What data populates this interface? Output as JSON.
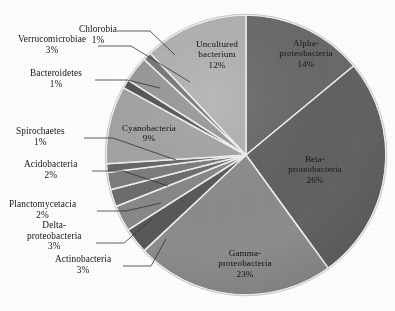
{
  "chart_data": {
    "type": "pie",
    "title": "",
    "subtitle": "",
    "xlabel": "",
    "ylabel": "",
    "legend_position": "none",
    "grid": false,
    "units": "percent",
    "total": 100,
    "start_angle_deg": 0,
    "direction": "clockwise",
    "center": {
      "x": 246,
      "y": 155
    },
    "radius": 140,
    "categories": [
      "Alpha-proteobacteria",
      "Beta-proteobacteria",
      "Gamma-proteobacteria",
      "Actinobacteria",
      "Delta-proteobacteria",
      "Planctomycetacia",
      "Acidobacteria",
      "Spirochaetes",
      "Cyanobacteria",
      "Bacteroidetes",
      "Verrucomicrobiae",
      "Chlorobia",
      "Uncultured bacterium"
    ],
    "values": [
      14,
      26,
      23,
      3,
      3,
      2,
      2,
      1,
      9,
      1,
      3,
      1,
      12
    ],
    "slices": [
      {
        "label": "Alpha-proteobacteria",
        "label_line1": "Alpha-",
        "label_line2": "proteobacteria",
        "value": 14,
        "pct_text": "14%",
        "color": "#6b6b6b",
        "label_placement": "inside"
      },
      {
        "label": "Beta-proteobacteria",
        "label_line1": "Beta-",
        "label_line2": "proteobacteria",
        "value": 26,
        "pct_text": "26%",
        "color": "#636363",
        "label_placement": "inside"
      },
      {
        "label": "Gamma-proteobacteria",
        "label_line1": "Gamma-",
        "label_line2": "proteobacteria",
        "value": 23,
        "pct_text": "23%",
        "color": "#8e8e8e",
        "label_placement": "inside"
      },
      {
        "label": "Actinobacteria",
        "label_line1": "Actinobacteria",
        "label_line2": "",
        "value": 3,
        "pct_text": "3%",
        "color": "#5a5a5a",
        "label_placement": "outside"
      },
      {
        "label": "Delta-proteobacteria",
        "label_line1": "Delta-",
        "label_line2": "proteobacteria",
        "value": 3,
        "pct_text": "3%",
        "color": "#8a8a8a",
        "label_placement": "outside"
      },
      {
        "label": "Planctomycetacia",
        "label_line1": "Planctomycetacia",
        "label_line2": "",
        "value": 2,
        "pct_text": "2%",
        "color": "#6e6e6e",
        "label_placement": "outside"
      },
      {
        "label": "Acidobacteria",
        "label_line1": "Acidobacteria",
        "label_line2": "",
        "value": 2,
        "pct_text": "2%",
        "color": "#7e7e7e",
        "label_placement": "outside"
      },
      {
        "label": "Spirochaetes",
        "label_line1": "Spirochaetes",
        "label_line2": "",
        "value": 1,
        "pct_text": "1%",
        "color": "#676767",
        "label_placement": "outside"
      },
      {
        "label": "Cyanobacteria",
        "label_line1": "Cyanobacteria",
        "label_line2": "",
        "value": 9,
        "pct_text": "9%",
        "color": "#a6a6a6",
        "label_placement": "inside"
      },
      {
        "label": "Bacteroidetes",
        "label_line1": "Bacteroidetes",
        "label_line2": "",
        "value": 1,
        "pct_text": "1%",
        "color": "#565656",
        "label_placement": "outside"
      },
      {
        "label": "Verrucomicrobiae",
        "label_line1": "Verrucomicrobiae",
        "label_line2": "",
        "value": 3,
        "pct_text": "3%",
        "color": "#9a9a9a",
        "label_placement": "outside"
      },
      {
        "label": "Chlorobia",
        "label_line1": "Chlorobia",
        "label_line2": "",
        "value": 1,
        "pct_text": "1%",
        "color": "#787878",
        "label_placement": "outside"
      },
      {
        "label": "Uncultured bacterium",
        "label_line1": "Uncultured",
        "label_line2": "bacterium",
        "value": 12,
        "pct_text": "12%",
        "color": "#b4b4b4",
        "label_placement": "inside"
      }
    ]
  },
  "labels": {
    "chlorobia": {
      "name": "Chlorobia",
      "pct": "1%"
    },
    "verrucomicrobiae": {
      "name": "Verrucomicrobiae",
      "pct": "3%"
    },
    "bacteroidetes": {
      "name": "Bacteroidetes",
      "pct": "1%"
    },
    "spirochaetes": {
      "name": "Spirochaetes",
      "pct": "1%"
    },
    "acidobacteria": {
      "name": "Acidobacteria",
      "pct": "2%"
    },
    "planctomycetacia": {
      "name": "Planctomycetacia",
      "pct": "2%"
    },
    "delta_l1": {
      "name": "Delta-",
      "l2": "proteobacteria",
      "pct": "3%"
    },
    "actinobacteria": {
      "name": "Actinobacteria",
      "pct": "3%"
    },
    "uncultured": {
      "l1": "Uncultured",
      "l2": "bacterium",
      "pct": "12%"
    },
    "cyanobacteria": {
      "name": "Cyanobacteria",
      "pct": "9%"
    },
    "alpha": {
      "l1": "Alpha-",
      "l2": "proteobacteria",
      "pct": "14%"
    },
    "beta": {
      "l1": "Beta-",
      "l2": "proteobacteria",
      "pct": "26%"
    },
    "gamma": {
      "l1": "Gamma-",
      "l2": "proteobacteria",
      "pct": "23%"
    }
  }
}
